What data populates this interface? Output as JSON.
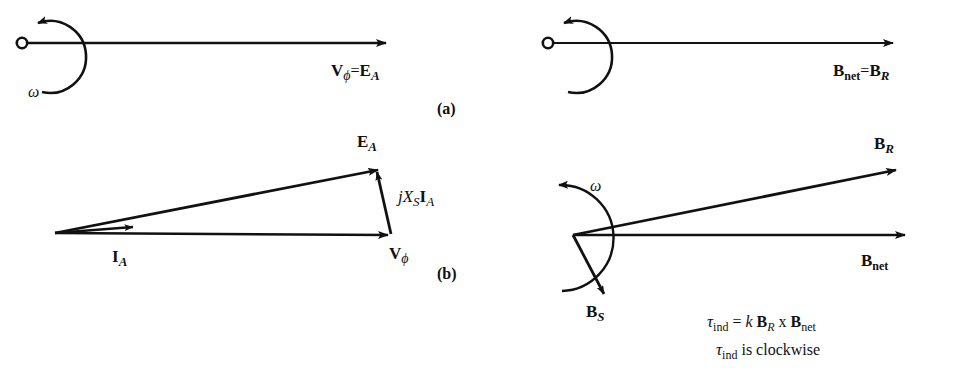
{
  "figure": {
    "background_color": "#ffffff",
    "stroke_color": "#111111"
  },
  "panels": [
    {
      "id": "panel-a",
      "letter_label": "(a)",
      "left_diagram": {
        "name": "no-load-phasor-diagram",
        "rotation_symbol": "ω",
        "vector_labels": [
          {
            "name": "v-phi-equals-ea",
            "base": "V",
            "sub": "ϕ",
            "relation": "=",
            "base2": "E",
            "sub2": "A"
          }
        ]
      },
      "right_diagram": {
        "name": "no-load-field-diagram",
        "vector_labels": [
          {
            "name": "bnet-equals-br",
            "base": "B",
            "sub": "net",
            "relation": "=",
            "base2": "B",
            "sub2": "R"
          }
        ]
      }
    },
    {
      "id": "panel-b",
      "letter_label": "(b)",
      "left_diagram": {
        "name": "loaded-phasor-diagram",
        "vector_labels": [
          {
            "name": "ea-label",
            "base": "E",
            "sub": "A"
          },
          {
            "name": "jxsia-label",
            "text": "jX",
            "sub": "S",
            "text2": "I",
            "sub2": "A"
          },
          {
            "name": "ia-label",
            "base": "I",
            "sub": "A"
          },
          {
            "name": "v-phi-label",
            "base": "V",
            "sub": "ϕ"
          }
        ]
      },
      "right_diagram": {
        "name": "loaded-field-diagram",
        "rotation_symbol": "ω",
        "vector_labels": [
          {
            "name": "br-label",
            "base": "B",
            "sub": "R"
          },
          {
            "name": "bnet-label",
            "base": "B",
            "sub": "net"
          },
          {
            "name": "bs-label",
            "base": "B",
            "sub": "S"
          }
        ],
        "equations": [
          {
            "name": "induced-torque-equation",
            "tau": "τ",
            "tau_sub": "ind",
            "eq": "=",
            "k": "k",
            "b1": "B",
            "b1_sub": "R",
            "cross": "x",
            "b2": "B",
            "b2_sub": "net"
          },
          {
            "name": "torque-direction-statement",
            "tau": "τ",
            "tau_sub": "ind",
            "text": "is clockwise"
          }
        ]
      }
    }
  ]
}
